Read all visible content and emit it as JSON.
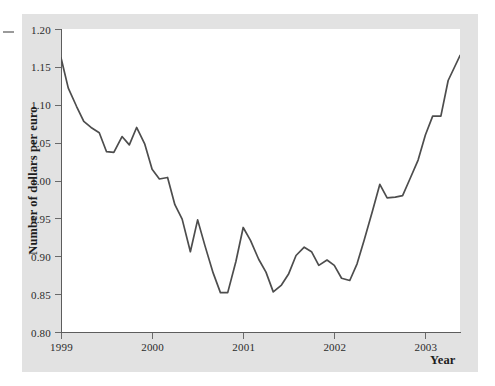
{
  "chart_data": {
    "type": "line",
    "title": "",
    "xlabel": "Year",
    "ylabel": "Number of dollars per euro",
    "xlim": [
      1999.0,
      2003.38
    ],
    "ylim": [
      0.8,
      1.2
    ],
    "grid": false,
    "legend": "none",
    "series_color": "#4d4d4d",
    "x_tick_labels": [
      "1999",
      "2000",
      "2001",
      "2002",
      "2003"
    ],
    "x_tick_values": [
      1999,
      2000,
      2001,
      2002,
      2003
    ],
    "y_tick_labels": [
      "0.80",
      "0.85",
      "0.90",
      "0.95",
      "1.00",
      "1.05",
      "1.10",
      "1.15",
      "1.20"
    ],
    "y_tick_values": [
      0.8,
      0.85,
      0.9,
      0.95,
      1.0,
      1.05,
      1.1,
      1.15,
      1.2
    ],
    "series": [
      {
        "name": "US dollars per euro",
        "x": [
          1999.0,
          1999.08,
          1999.17,
          1999.25,
          1999.33,
          1999.42,
          1999.5,
          1999.58,
          1999.67,
          1999.75,
          1999.83,
          1999.92,
          2000.0,
          2000.08,
          2000.17,
          2000.25,
          2000.33,
          2000.42,
          2000.5,
          2000.58,
          2000.67,
          2000.75,
          2000.83,
          2000.92,
          2001.0,
          2001.08,
          2001.17,
          2001.25,
          2001.33,
          2001.42,
          2001.5,
          2001.58,
          2001.67,
          2001.75,
          2001.83,
          2001.92,
          2002.0,
          2002.08,
          2002.17,
          2002.25,
          2002.33,
          2002.42,
          2002.5,
          2002.58,
          2002.67,
          2002.75,
          2002.83,
          2002.92,
          2003.0,
          2003.08,
          2003.17,
          2003.25,
          2003.38
        ],
        "y": [
          1.162,
          1.122,
          1.098,
          1.078,
          1.07,
          1.063,
          1.038,
          1.037,
          1.058,
          1.047,
          1.07,
          1.048,
          1.015,
          1.002,
          1.004,
          0.968,
          0.949,
          0.906,
          0.948,
          0.914,
          0.878,
          0.852,
          0.852,
          0.893,
          0.938,
          0.921,
          0.896,
          0.879,
          0.853,
          0.862,
          0.877,
          0.901,
          0.912,
          0.906,
          0.888,
          0.895,
          0.888,
          0.871,
          0.868,
          0.89,
          0.922,
          0.96,
          0.995,
          0.977,
          0.978,
          0.98,
          1.002,
          1.027,
          1.06,
          1.085,
          1.085,
          1.132,
          1.165
        ]
      }
    ]
  },
  "axis": {
    "y_label": "Number of dollars per euro",
    "x_label": "Year"
  }
}
